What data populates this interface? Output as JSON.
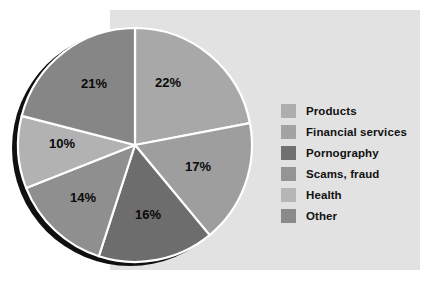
{
  "chart_data": {
    "type": "pie",
    "title": "",
    "subtitle": "",
    "xlabel": "",
    "ylabel": "",
    "legend_position": "right",
    "grid": false,
    "categories": [
      "Products",
      "Financial services",
      "Pornography",
      "Scams, fraud",
      "Health",
      "Other"
    ],
    "values": [
      22,
      17,
      16,
      14,
      10,
      21
    ],
    "data_labels": [
      "22%",
      "17%",
      "16%",
      "14%",
      "10%",
      "21%"
    ],
    "slice_colors": [
      "#a8a8a8",
      "#9e9e9e",
      "#6d6d6d",
      "#8f8f8f",
      "#b2b2b2",
      "#868686"
    ],
    "start_angle_deg": 0,
    "direction": "clockwise",
    "separator_color": "#ffffff",
    "slices": [
      {
        "label": "Products",
        "value": 22,
        "data_label": "22%",
        "color": "#a8a8a8",
        "label_x": 168,
        "label_y": 84
      },
      {
        "label": "Financial services",
        "value": 17,
        "data_label": "17%",
        "color": "#9e9e9e",
        "label_x": 198,
        "label_y": 168
      },
      {
        "label": "Pornography",
        "value": 16,
        "data_label": "16%",
        "color": "#6d6d6d",
        "label_x": 148,
        "label_y": 216
      },
      {
        "label": "Scams, fraud",
        "value": 14,
        "data_label": "14%",
        "color": "#8f8f8f",
        "label_x": 83,
        "label_y": 199
      },
      {
        "label": "Health",
        "value": 10,
        "data_label": "10%",
        "color": "#b2b2b2",
        "label_x": 62,
        "label_y": 145
      },
      {
        "label": "Other",
        "value": 21,
        "data_label": "21%",
        "color": "#868686",
        "label_x": 94,
        "label_y": 85
      }
    ]
  },
  "legend": {
    "items": [
      {
        "label": "Products",
        "color": "#aeaeae"
      },
      {
        "label": "Financial services",
        "color": "#a3a3a3"
      },
      {
        "label": "Pornography",
        "color": "#707070"
      },
      {
        "label": "Scams, fraud",
        "color": "#949494"
      },
      {
        "label": "Health",
        "color": "#b6b6b6"
      },
      {
        "label": "Other",
        "color": "#8a8a8a"
      }
    ]
  },
  "colors": {
    "page_background": "#ffffff",
    "panel_background": "#e2e2e2",
    "slice_outline": "#ffffff",
    "shadow": "#101010",
    "label_text": "#0a0a0a"
  }
}
